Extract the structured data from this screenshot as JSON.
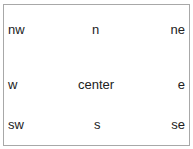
{
  "labels": {
    "nw": "nw",
    "n": "n",
    "ne": "ne",
    "w": "w",
    "center": "center",
    "e": "e",
    "sw": "sw",
    "s": "s",
    "se": "se"
  },
  "colors": {
    "border": "#a8a8a8",
    "text": "#222222",
    "background": "#ffffff"
  }
}
